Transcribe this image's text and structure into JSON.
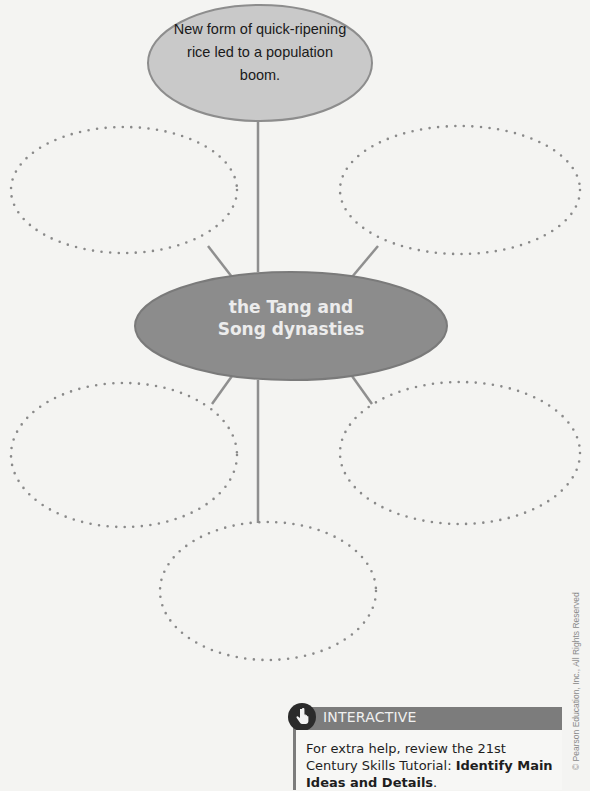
{
  "diagram": {
    "type": "concept-web",
    "center": {
      "text_line1": "the Tang and",
      "text_line2": "Song dynasties"
    },
    "filled_node": {
      "line1": "New form of quick-ripening",
      "line2": "rice led to a population",
      "line3": "boom."
    },
    "empty_nodes": [
      "upper-left",
      "upper-right",
      "lower-left",
      "lower-right",
      "bottom"
    ],
    "colors": {
      "center_fill": "#8c8c8c",
      "top_fill": "#c9c9c9",
      "connector": "#8f8f8f",
      "dots": "#8a8a8a",
      "background": "#f4f4f2"
    }
  },
  "interactive": {
    "label": "INTERACTIVE",
    "text_prefix": "For extra help, review the 21st Century Skills Tutorial: ",
    "text_bold": "Identify Main Ideas and Details",
    "text_suffix": "."
  },
  "copyright": "© Pearson Education, Inc., All Rights Reserved"
}
